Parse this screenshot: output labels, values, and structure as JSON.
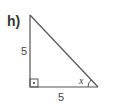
{
  "problem": {
    "label": "h)"
  },
  "triangle": {
    "type": "right triangle",
    "vertical_leg": "5",
    "horizontal_leg": "5",
    "angle_label": "x",
    "right_angle_marker": "square-with-dot",
    "stroke_color": "#555555"
  }
}
